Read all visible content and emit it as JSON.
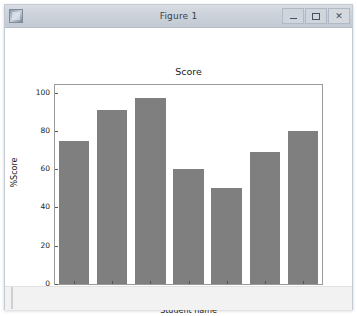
{
  "window": {
    "title": "Figure 1",
    "app_icon": "matplotlib-figure-icon",
    "controls": {
      "minimize_label": "–",
      "maximize_label": "❐",
      "close_label": "✕"
    }
  },
  "chart_data": {
    "type": "bar",
    "title": "Score",
    "xlabel": "Student name",
    "ylabel": "%Score",
    "categories": [
      "John",
      "Ted",
      "Lizy",
      "Elena",
      "Alex",
      "Albert",
      "Meg"
    ],
    "values": [
      75,
      91,
      97,
      60,
      50,
      69,
      80
    ],
    "yticks": [
      0,
      20,
      40,
      60,
      80,
      100
    ],
    "ylim": [
      0,
      104
    ],
    "grid": false,
    "legend": null,
    "bar_color": "#7f7f7f",
    "axes_color": "#9a9a9a",
    "figure_facecolor": "#ffffff"
  }
}
